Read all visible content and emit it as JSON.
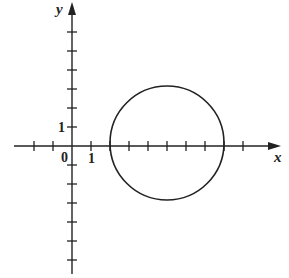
{
  "diagram": {
    "type": "coordinate-plane-with-circle",
    "axes": {
      "x_label": "x",
      "y_label": "y",
      "origin_label": "0",
      "x_unit_label": "1",
      "y_unit_label": "1",
      "x_ticks": [
        -2,
        -1,
        1,
        2,
        3,
        4,
        5,
        6,
        7,
        8,
        9
      ],
      "y_ticks": [
        -6,
        -5,
        -4,
        -3,
        -2,
        -1,
        1,
        2,
        3,
        4,
        5,
        6
      ]
    },
    "circle": {
      "center": [
        5,
        0
      ],
      "radius": 3
    },
    "colors": {
      "stroke": "#222222",
      "background": "#ffffff"
    }
  }
}
